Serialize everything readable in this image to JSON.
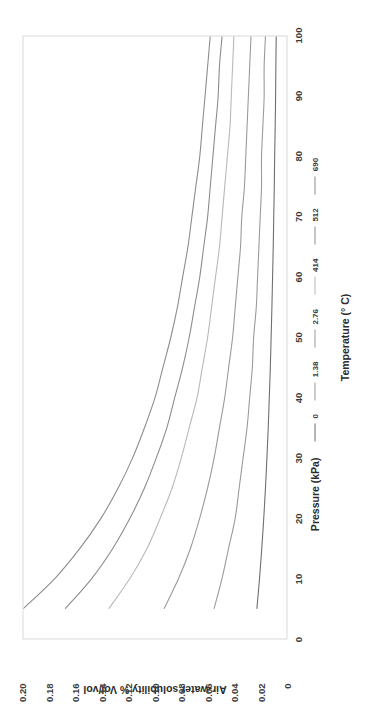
{
  "chart_data": {
    "type": "line",
    "title": "",
    "xlabel": "Temperature (° C)",
    "ylabel": "Air-water solubility % Vol/vol",
    "xlim": [
      0,
      100
    ],
    "ylim": [
      0,
      0.2
    ],
    "grid": false,
    "legend_position": "bottom",
    "legend_title": "Pressure (kPa)",
    "xticks": [
      "0",
      "10",
      "20",
      "30",
      "40",
      "50",
      "60",
      "70",
      "80",
      "90",
      "100"
    ],
    "xtick_values": [
      0,
      10,
      20,
      30,
      40,
      50,
      60,
      70,
      80,
      90,
      100
    ],
    "yticks": [
      "0",
      "0.02",
      "0.04",
      "0.06",
      "0.08",
      "0.10",
      "0.12",
      "0.14",
      "0.16",
      "0.18",
      "0.20"
    ],
    "ytick_values": [
      0,
      0.02,
      0.04,
      0.06,
      0.08,
      0.1,
      0.12,
      0.14,
      0.16,
      0.18,
      0.2
    ],
    "x": [
      5,
      10,
      15,
      20,
      25,
      30,
      35,
      40,
      45,
      50,
      55,
      60,
      65,
      70,
      75,
      80,
      85,
      90,
      95,
      100
    ],
    "series": [
      {
        "name": "690",
        "color": "#8c8c8c",
        "values": [
          0.2,
          0.176,
          0.157,
          0.141,
          0.128,
          0.117,
          0.108,
          0.1,
          0.094,
          0.088,
          0.083,
          0.079,
          0.075,
          0.072,
          0.069,
          0.066,
          0.064,
          0.062,
          0.06,
          0.058
        ]
      },
      {
        "name": "512",
        "color": "#8c8c8c",
        "values": [
          0.168,
          0.148,
          0.132,
          0.119,
          0.108,
          0.099,
          0.091,
          0.085,
          0.079,
          0.074,
          0.07,
          0.066,
          0.063,
          0.06,
          0.058,
          0.056,
          0.054,
          0.052,
          0.051,
          0.049
        ]
      },
      {
        "name": "414",
        "color": "#b8b8b8",
        "values": [
          0.135,
          0.119,
          0.106,
          0.096,
          0.087,
          0.08,
          0.074,
          0.068,
          0.064,
          0.06,
          0.057,
          0.054,
          0.051,
          0.049,
          0.047,
          0.045,
          0.043,
          0.042,
          0.041,
          0.04
        ]
      },
      {
        "name": "2.76",
        "color": "#9a9a9a",
        "values": [
          0.093,
          0.082,
          0.073,
          0.066,
          0.06,
          0.055,
          0.051,
          0.047,
          0.044,
          0.041,
          0.039,
          0.037,
          0.035,
          0.034,
          0.032,
          0.031,
          0.03,
          0.029,
          0.028,
          0.027
        ]
      },
      {
        "name": "1.38",
        "color": "#9a9a9a",
        "values": [
          0.055,
          0.049,
          0.044,
          0.039,
          0.036,
          0.033,
          0.03,
          0.028,
          0.026,
          0.025,
          0.023,
          0.022,
          0.021,
          0.02,
          0.019,
          0.019,
          0.018,
          0.017,
          0.017,
          0.016
        ]
      },
      {
        "name": "0",
        "color": "#6e6e6e",
        "values": [
          0.0225,
          0.0205,
          0.0188,
          0.0173,
          0.016,
          0.0149,
          0.0139,
          0.0131,
          0.0123,
          0.0117,
          0.0111,
          0.0106,
          0.0101,
          0.0097,
          0.0093,
          0.009,
          0.0086,
          0.0083,
          0.0081,
          0.0078
        ]
      }
    ],
    "legend_entries": [
      {
        "label": "0",
        "color": "#6e6e6e"
      },
      {
        "label": "1.38",
        "color": "#9a9a9a"
      },
      {
        "label": "2.76",
        "color": "#9a9a9a"
      },
      {
        "label": "414",
        "color": "#b8b8b8"
      },
      {
        "label": "512",
        "color": "#8c8c8c"
      },
      {
        "label": "690",
        "color": "#8c8c8c"
      }
    ]
  },
  "axes": {
    "x_title": "Temperature (° C)",
    "y_title": "Air-water solubility % Vol/vol"
  },
  "legend": {
    "title": "Pressure (kPa)"
  }
}
